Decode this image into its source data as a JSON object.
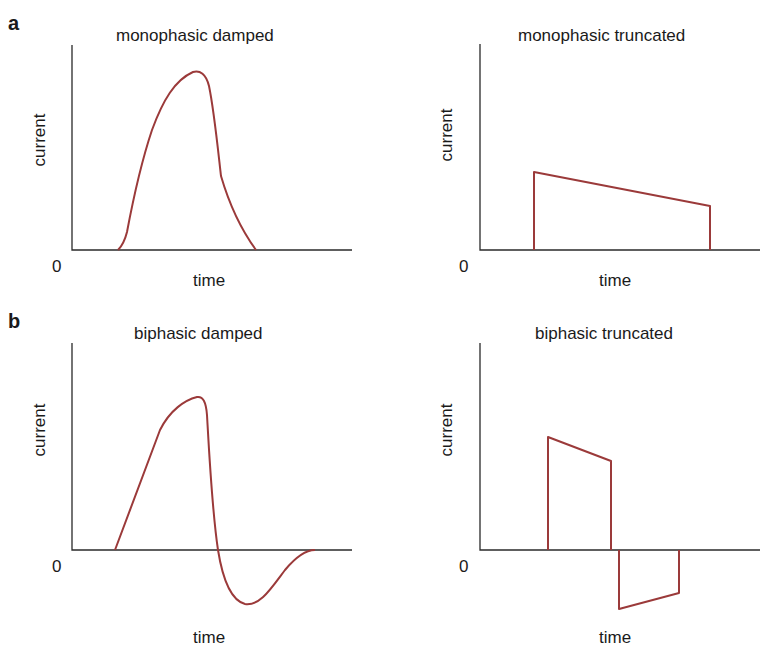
{
  "figure": {
    "sections": [
      {
        "letter": "a"
      },
      {
        "letter": "b"
      }
    ],
    "colors": {
      "waveform": "#9b3a3a",
      "axis": "#2a2a2a",
      "text": "#1a1a1a",
      "background": "#ffffff"
    },
    "panels": [
      {
        "id": "monophasic-damped",
        "title": "monophasic damped",
        "ylabel": "current",
        "xlabel": "time",
        "origin_label": "0"
      },
      {
        "id": "monophasic-truncated",
        "title": "monophasic truncated",
        "ylabel": "current",
        "xlabel": "time",
        "origin_label": "0"
      },
      {
        "id": "biphasic-damped",
        "title": "biphasic damped",
        "ylabel": "current",
        "xlabel": "time",
        "origin_label": "0"
      },
      {
        "id": "biphasic-truncated",
        "title": "biphasic truncated",
        "ylabel": "current",
        "xlabel": "time",
        "origin_label": "0"
      }
    ]
  }
}
